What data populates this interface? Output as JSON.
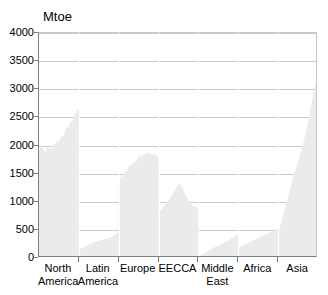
{
  "chart_data": {
    "type": "area",
    "title": "",
    "subtitle": "",
    "xlabel": "",
    "ylabel": "Mtoe",
    "unit_label": "Mtoe",
    "ylim": [
      0,
      4000
    ],
    "yticks": [
      0,
      500,
      1000,
      1500,
      2000,
      2500,
      3000,
      3500,
      4000
    ],
    "ytick_labels": [
      "0",
      "500",
      "1000",
      "1500",
      "2000",
      "2500",
      "3000",
      "3500",
      "4000"
    ],
    "grid": true,
    "legend": "none",
    "fill_color": "#ebebeb",
    "axis_color": "#808080",
    "grid_color": "#c9c9c9",
    "categories": [
      "North America",
      "Latin America",
      "Europe",
      "EECCA",
      "Middle East",
      "Africa",
      "Asia"
    ],
    "category_labels": [
      {
        "line1": "North",
        "line2": "America"
      },
      {
        "line1": "Latin",
        "line2": "America"
      },
      {
        "line1": "Europe",
        "line2": ""
      },
      {
        "line1": "EECCA",
        "line2": ""
      },
      {
        "line1": "Middle",
        "line2": "East"
      },
      {
        "line1": "Africa",
        "line2": ""
      },
      {
        "line1": "Asia",
        "line2": ""
      }
    ],
    "panels": [
      {
        "name": "North America",
        "start_value": 1900,
        "end_value": 2650,
        "peak_value": 2660,
        "min_value": 1870,
        "values": [
          1900,
          1960,
          2010,
          1930,
          1880,
          1900,
          1950,
          1990,
          1950,
          1930,
          1980,
          2030,
          2010,
          2050,
          2090,
          2060,
          2120,
          2180,
          2150,
          2210,
          2280,
          2330,
          2300,
          2380,
          2440,
          2420,
          2500,
          2560,
          2600,
          2660,
          2640
        ]
      },
      {
        "name": "Latin America",
        "start_value": 150,
        "end_value": 460,
        "peak_value": 460,
        "min_value": 150,
        "values": [
          150,
          160,
          172,
          185,
          196,
          205,
          218,
          232,
          242,
          250,
          262,
          272,
          278,
          288,
          296,
          300,
          308,
          318,
          322,
          330,
          338,
          344,
          352,
          362,
          372,
          384,
          398,
          412,
          428,
          444,
          460
        ]
      },
      {
        "name": "Europe",
        "start_value": 1350,
        "end_value": 1790,
        "peak_value": 1900,
        "min_value": 1340,
        "values": [
          1350,
          1420,
          1470,
          1430,
          1500,
          1560,
          1540,
          1600,
          1660,
          1640,
          1700,
          1680,
          1740,
          1700,
          1760,
          1820,
          1780,
          1840,
          1800,
          1860,
          1820,
          1880,
          1840,
          1900,
          1860,
          1820,
          1860,
          1840,
          1800,
          1820,
          1790
        ]
      },
      {
        "name": "EECCA",
        "start_value": 800,
        "end_value": 900,
        "peak_value": 1340,
        "min_value": 790,
        "values": [
          800,
          830,
          860,
          890,
          920,
          950,
          980,
          1010,
          1040,
          1080,
          1110,
          1150,
          1190,
          1230,
          1270,
          1310,
          1340,
          1300,
          1250,
          1190,
          1140,
          1090,
          1040,
          1000,
          970,
          950,
          930,
          915,
          905,
          900,
          900
        ]
      },
      {
        "name": "Middle East",
        "start_value": 30,
        "end_value": 420,
        "peak_value": 420,
        "min_value": 30,
        "values": [
          30,
          40,
          52,
          66,
          80,
          94,
          108,
          122,
          136,
          150,
          162,
          176,
          188,
          200,
          212,
          224,
          236,
          248,
          260,
          272,
          284,
          296,
          308,
          322,
          336,
          350,
          364,
          378,
          392,
          406,
          420
        ]
      },
      {
        "name": "Africa",
        "start_value": 180,
        "end_value": 520,
        "peak_value": 520,
        "min_value": 180,
        "values": [
          180,
          192,
          204,
          216,
          228,
          240,
          252,
          264,
          276,
          288,
          298,
          310,
          322,
          334,
          344,
          356,
          368,
          378,
          390,
          400,
          410,
          422,
          434,
          444,
          456,
          466,
          478,
          488,
          498,
          510,
          520
        ]
      },
      {
        "name": "Asia",
        "start_value": 450,
        "end_value": 3250,
        "peak_value": 3250,
        "min_value": 450,
        "values": [
          450,
          520,
          600,
          690,
          780,
          870,
          960,
          1050,
          1140,
          1230,
          1320,
          1400,
          1480,
          1560,
          1640,
          1720,
          1800,
          1880,
          1960,
          2050,
          2150,
          2250,
          2360,
          2480,
          2600,
          2720,
          2850,
          2970,
          3080,
          3180,
          3250
        ]
      }
    ]
  }
}
